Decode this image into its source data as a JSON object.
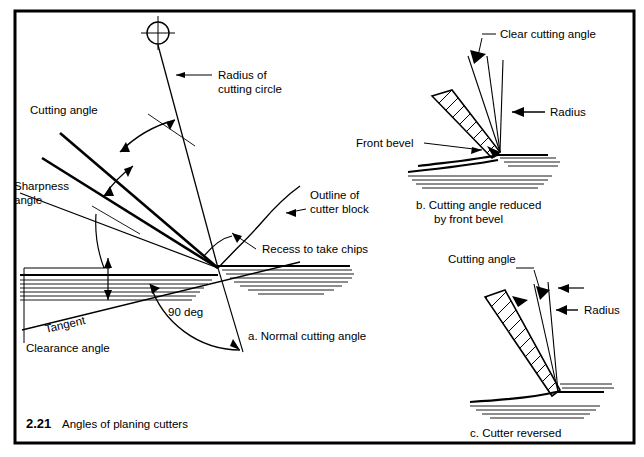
{
  "figure": {
    "number": "2.21",
    "caption": "Angles of planing cutters",
    "border_color": "#000000",
    "line_color": "#000000",
    "background": "#ffffff"
  },
  "main_diagram": {
    "name": "a-normal-cutting-angle",
    "caption": "a. Normal cutting angle",
    "labels": {
      "cutting_angle": "Cutting angle",
      "sharpness_angle_line1": "Sharpness",
      "sharpness_angle_line2": "angle",
      "radius_line1": "Radius of",
      "radius_line2": "cutting circle",
      "outline_line1": "Outline of",
      "outline_line2": "cutter block",
      "recess": "Recess to take chips",
      "tangent": "Tangent",
      "clearance_angle": "Clearance angle",
      "right_angle": "90 deg"
    },
    "center_mark": "crosshair-circle-icon"
  },
  "figure_b": {
    "name": "b-cutting-angle-reduced",
    "caption_line1": "b. Cutting angle reduced",
    "caption_line2": "by front bevel",
    "labels": {
      "clear_cutting_angle": "Clear cutting angle",
      "radius": "Radius",
      "front_bevel": "Front bevel"
    }
  },
  "figure_c": {
    "name": "c-cutter-reversed",
    "caption": "c. Cutter reversed",
    "labels": {
      "cutting_angle": "Cutting angle",
      "radius": "Radius"
    }
  }
}
